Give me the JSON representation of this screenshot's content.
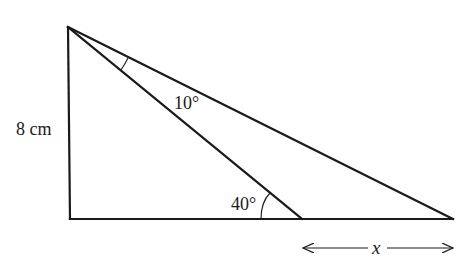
{
  "diagram": {
    "type": "geometry-right-triangle",
    "vertices": {
      "top": {
        "x": 68,
        "y": 27
      },
      "right_angle": {
        "x": 70,
        "y": 219
      },
      "base_right": {
        "x": 453,
        "y": 219
      },
      "cevian_foot": {
        "x": 302,
        "y": 219
      }
    },
    "labels": {
      "side_height": "8 cm",
      "angle_top": "10°",
      "angle_base": "40°",
      "unknown_length": "x"
    },
    "segments": [
      {
        "name": "vertical-side",
        "from": "top",
        "to": "right_angle"
      },
      {
        "name": "base",
        "from": "right_angle",
        "to": "base_right"
      },
      {
        "name": "hypotenuse",
        "from": "top",
        "to": "base_right"
      },
      {
        "name": "cevian",
        "from": "top",
        "to": "cevian_foot"
      }
    ],
    "dimension_arrow": {
      "from_x": 302,
      "to_x": 453,
      "y": 248,
      "label": "x"
    },
    "stroke_color": "#1a1a1a",
    "background": "#ffffff"
  }
}
